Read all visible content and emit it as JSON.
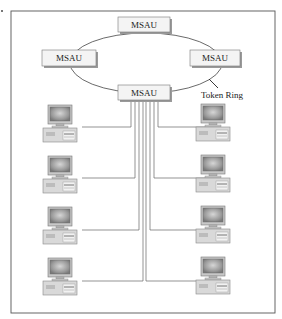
{
  "diagram": {
    "type": "token-ring-network",
    "ring_label": "Token Ring",
    "msau_nodes": [
      {
        "id": "top",
        "label": "MSAU"
      },
      {
        "id": "left",
        "label": "MSAU"
      },
      {
        "id": "right",
        "label": "MSAU"
      },
      {
        "id": "bottom",
        "label": "MSAU"
      }
    ],
    "workstations": {
      "left_column": 4,
      "right_column": 4
    },
    "colors": {
      "frame": "#555555",
      "ring": "#444444",
      "msau_fill": "#f4f4f4",
      "msau_shadow": "#9a9a9a",
      "wire": "#666666",
      "screen": "#9b9b9b",
      "case": "#d8d8d8"
    }
  }
}
